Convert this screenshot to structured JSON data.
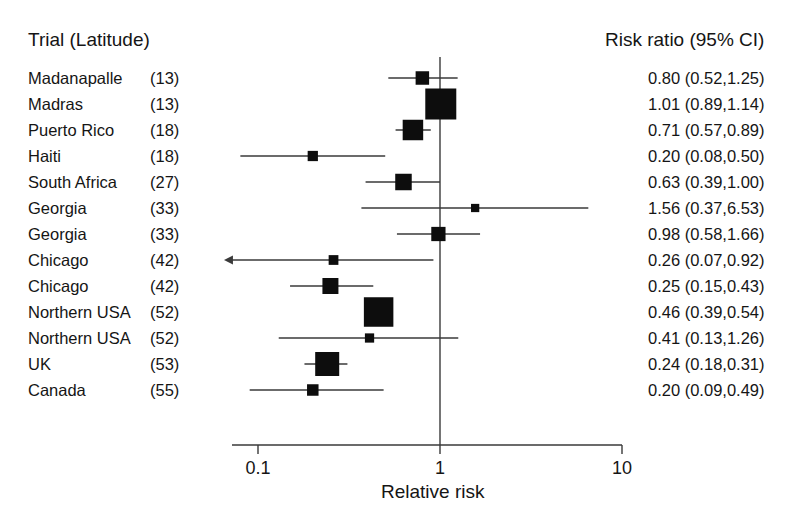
{
  "columns": {
    "trial_header": "Trial (Latitude)",
    "riskratio_header": "Risk ratio (95% CI)"
  },
  "axis": {
    "title": "Relative risk",
    "ticks": [
      "0.1",
      "1",
      "10"
    ],
    "null_line_value": "1"
  },
  "colors": {
    "ink": "#151515",
    "line": "#3a3a3a",
    "marker": "#0d0d0d",
    "background": "#ffffff"
  },
  "chart_data": {
    "type": "forest",
    "title": "",
    "xlabel": "Relative risk",
    "ylabel": "",
    "xscale": "log",
    "xlim": [
      0.1,
      10
    ],
    "xticks": [
      0.1,
      1,
      10
    ],
    "reference_line": 1,
    "grid": false,
    "legend": "none",
    "effect_measure": "Risk ratio (95% CI)",
    "rows": [
      {
        "trial": "Madanapalle",
        "latitude": "(13)",
        "lat": 13,
        "rr": 0.8,
        "lcl": 0.52,
        "ucl": 1.25,
        "label": "0.80 (0.52,1.25)",
        "weight": 0.3,
        "clipped_left": false
      },
      {
        "trial": "Madras",
        "latitude": "(13)",
        "lat": 13,
        "rr": 1.01,
        "lcl": 0.89,
        "ucl": 1.14,
        "label": "1.01 (0.89,1.14)",
        "weight": 1.0,
        "clipped_left": false
      },
      {
        "trial": "Puerto Rico",
        "latitude": "(18)",
        "lat": 18,
        "rr": 0.71,
        "lcl": 0.57,
        "ucl": 0.89,
        "label": "0.71 (0.57,0.89)",
        "weight": 0.58,
        "clipped_left": false
      },
      {
        "trial": "Haiti",
        "latitude": "(18)",
        "lat": 18,
        "rr": 0.2,
        "lcl": 0.08,
        "ucl": 0.5,
        "label": "0.20 (0.08,0.50)",
        "weight": 0.17,
        "clipped_left": false
      },
      {
        "trial": "South Africa",
        "latitude": "(27)",
        "lat": 27,
        "rr": 0.63,
        "lcl": 0.39,
        "ucl": 1.0,
        "label": "0.63 (0.39,1.00)",
        "weight": 0.42,
        "clipped_left": false
      },
      {
        "trial": "Georgia",
        "latitude": "(33)",
        "lat": 33,
        "rr": 1.56,
        "lcl": 0.37,
        "ucl": 6.53,
        "label": "1.56 (0.37,6.53)",
        "weight": 0.09,
        "clipped_left": false
      },
      {
        "trial": "Georgia",
        "latitude": "(33)",
        "lat": 33,
        "rr": 0.98,
        "lcl": 0.58,
        "ucl": 1.66,
        "label": "0.98 (0.58,1.66)",
        "weight": 0.33,
        "clipped_left": false
      },
      {
        "trial": "Chicago",
        "latitude": "(42)",
        "lat": 42,
        "rr": 0.26,
        "lcl": 0.07,
        "ucl": 0.92,
        "label": "0.26 (0.07,0.92)",
        "weight": 0.15,
        "clipped_left": true
      },
      {
        "trial": "Chicago",
        "latitude": "(42)",
        "lat": 42,
        "rr": 0.25,
        "lcl": 0.15,
        "ucl": 0.43,
        "label": "0.25 (0.15,0.43)",
        "weight": 0.4,
        "clipped_left": false
      },
      {
        "trial": "Northern USA",
        "latitude": "(52)",
        "lat": 52,
        "rr": 0.46,
        "lcl": 0.39,
        "ucl": 0.54,
        "label": "0.46 (0.39,0.54)",
        "weight": 0.94,
        "clipped_left": false
      },
      {
        "trial": "Northern USA",
        "latitude": "(52)",
        "lat": 52,
        "rr": 0.41,
        "lcl": 0.13,
        "ucl": 1.26,
        "label": "0.41 (0.13,1.26)",
        "weight": 0.13,
        "clipped_left": false
      },
      {
        "trial": "UK",
        "latitude": "(53)",
        "lat": 53,
        "rr": 0.24,
        "lcl": 0.18,
        "ucl": 0.31,
        "label": "0.24 (0.18,0.31)",
        "weight": 0.72,
        "clipped_left": false
      },
      {
        "trial": "Canada",
        "latitude": "(55)",
        "lat": 55,
        "rr": 0.2,
        "lcl": 0.09,
        "ucl": 0.49,
        "label": "0.20 (0.09,0.49)",
        "weight": 0.22,
        "clipped_left": false
      }
    ]
  }
}
